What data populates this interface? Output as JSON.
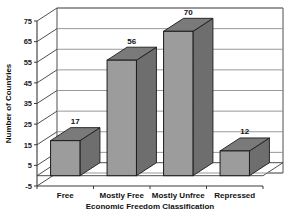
{
  "chart_data": {
    "type": "bar",
    "title": "",
    "categories": [
      "Free",
      "Mostly Free",
      "Mostly Unfree",
      "Repressed"
    ],
    "values": [
      17,
      56,
      70,
      12
    ],
    "value_labels": [
      "17",
      "56",
      "70",
      "12"
    ],
    "xlabel": "Economic Freedom Classification",
    "ylabel": "Number of Countries",
    "ylim": [
      -5,
      75
    ],
    "yticks": [
      75,
      65,
      55,
      45,
      35,
      25,
      15,
      5,
      -5
    ],
    "ytick_labels": [
      "75",
      "65",
      "55",
      "45",
      "35",
      "25",
      "15",
      "5",
      "-5"
    ],
    "grid": true,
    "legend": false,
    "three_d": true,
    "colors": {
      "bar_front": "#9c9c9c",
      "bar_top": "#7a7a7a",
      "bar_side": "#6e6e6e",
      "bar_edge": "#1c1c1c",
      "grid_line": "#8d8d8d",
      "axis_line": "#3a3a3a",
      "wall": "#ffffff",
      "floor": "#ffffff",
      "background": "#ffffff"
    }
  }
}
